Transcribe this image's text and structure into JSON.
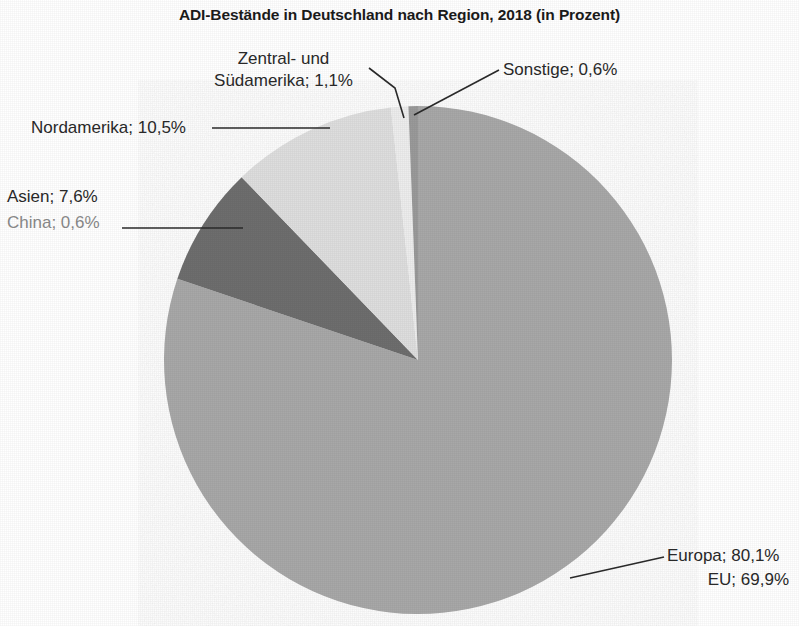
{
  "chart_data": {
    "type": "pie",
    "title": "ADI-Bestände in Deutschland nach Region, 2018 (in Prozent)",
    "unit": "%",
    "decimal_separator": ",",
    "legend_position": "callout-labels",
    "grid": false,
    "categories": [
      "Europa",
      "Nordamerika",
      "Asien",
      "Zentral- und Südamerika",
      "Sonstige"
    ],
    "values": [
      80.1,
      10.5,
      7.6,
      1.1,
      0.6
    ],
    "value_labels": [
      "80,1%",
      "10,5%",
      "7,6%",
      "1,1%",
      "0,6%"
    ],
    "colors": [
      "#a8a8a8",
      "#dedede",
      "#6e6e6e",
      "#ededed",
      "#9a9a9a"
    ],
    "sub_items": [
      {
        "parent": "Europa",
        "name": "EU",
        "value": 69.9,
        "value_label": "69,9%"
      },
      {
        "parent": "Asien",
        "name": "China",
        "value": 0.6,
        "value_label": "0,6%"
      }
    ],
    "start_angle_deg": 0,
    "direction": "clockwise"
  },
  "title": "ADI-Bestände in Deutschland nach Region, 2018 (in Prozent)",
  "labels": {
    "zentral_suedamerika_line1": "Zentral- und",
    "zentral_suedamerika_line2": "Südamerika; 1,1%",
    "sonstige": "Sonstige; 0,6%",
    "nordamerika": "Nordamerika; 10,5%",
    "asien": "Asien; 7,6%",
    "china": "China; 0,6%",
    "europa": "Europa; 80,1%",
    "eu": "EU; 69,9%"
  },
  "colors": {
    "europa": "#a8a8a8",
    "nordamerika": "#dedede",
    "asien": "#6e6e6e",
    "zentral_suedamerika": "#ededed",
    "sonstige": "#9a9a9a",
    "text": "#2a2a2a",
    "sub_text": "#8a8a8a",
    "leader_line": "#2b2b2b",
    "background": "#ffffff"
  }
}
